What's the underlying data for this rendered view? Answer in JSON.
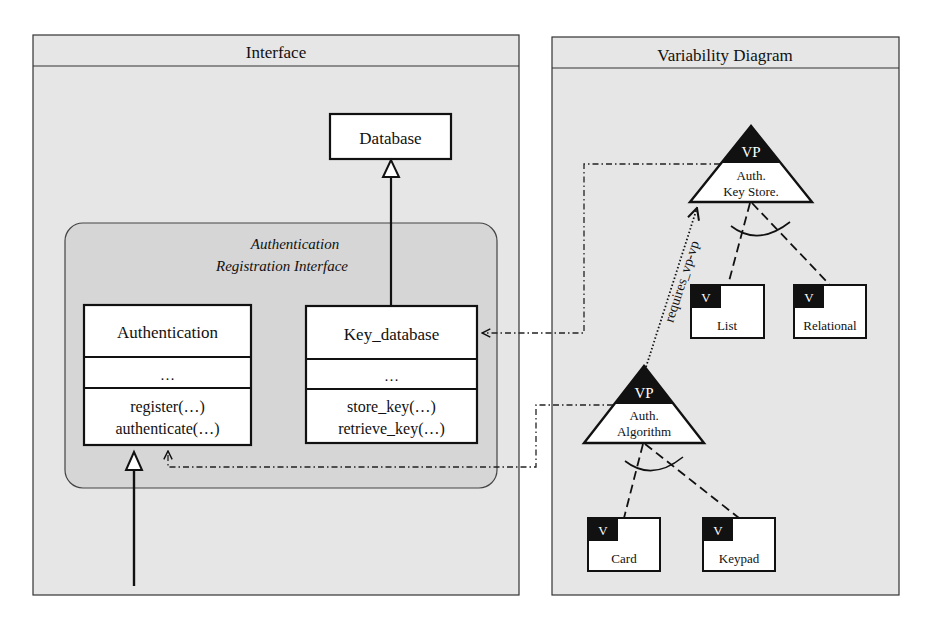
{
  "panels": {
    "interface": {
      "title": "Interface"
    },
    "variability": {
      "title": "Variability Diagram"
    }
  },
  "interface": {
    "database": {
      "name": "Database"
    },
    "group": {
      "line1": "Authentication",
      "line2": "Registration Interface"
    },
    "authentication": {
      "name": "Authentication",
      "attributes": "…",
      "ops": [
        "register(…)",
        "authenticate(…)"
      ]
    },
    "key_database": {
      "name": "Key_database",
      "attributes": "…",
      "ops": [
        "store_key(…)",
        "retrieve_key(…)"
      ]
    }
  },
  "variability": {
    "vp_keystore": {
      "tag": "VP",
      "line1": "Auth.",
      "line2": "Key Store."
    },
    "vp_algorithm": {
      "tag": "VP",
      "line1": "Auth.",
      "line2": "Algorithm"
    },
    "variants": {
      "list": {
        "tag": "V",
        "name": "List"
      },
      "relational": {
        "tag": "V",
        "name": "Relational"
      },
      "card": {
        "tag": "V",
        "name": "Card"
      },
      "keypad": {
        "tag": "V",
        "name": "Keypad"
      }
    },
    "constraint": {
      "label": "requires_vp-vp"
    }
  },
  "colors": {
    "panel_bg": "#e6e6e6",
    "group_bg": "#d6d6d6",
    "box_bg": "#ffffff",
    "ink": "#111111"
  }
}
